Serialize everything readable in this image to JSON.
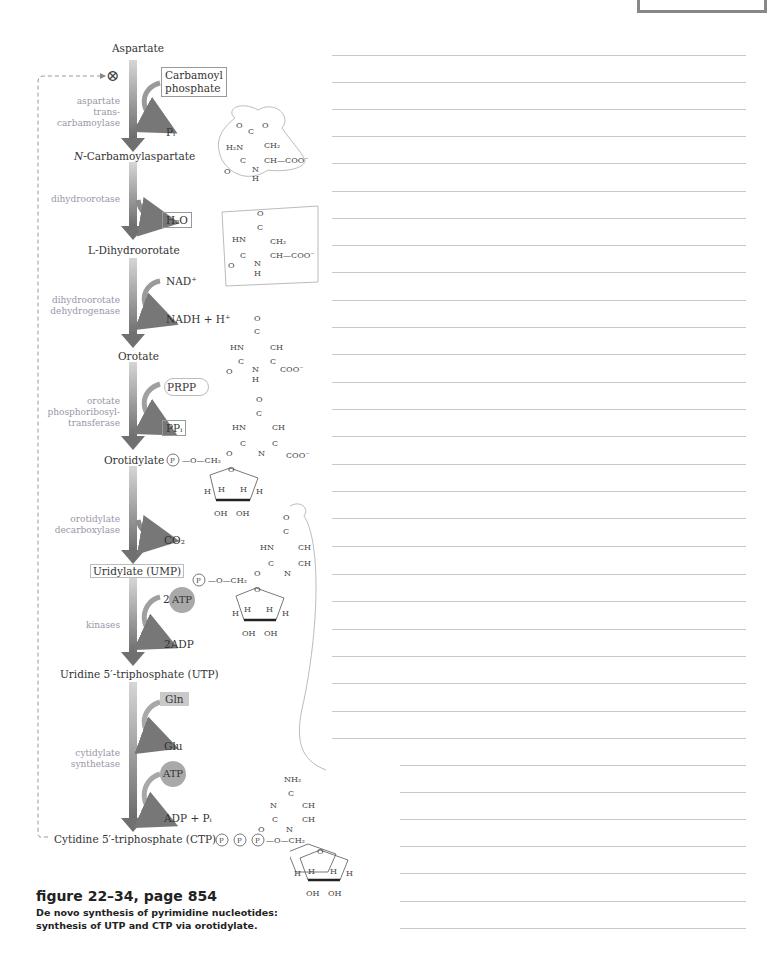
{
  "figure": {
    "title": "figure 22–34, page 854",
    "caption_line1": "De novo synthesis of pyrimidine nucleotides:",
    "caption_line2": "synthesis of UTP and CTP via orotidylate."
  },
  "pathway": {
    "feedback_inhibition_symbol": "⊗",
    "metabolites": [
      {
        "name": "Aspartate"
      },
      {
        "name": "N-Carbamoylaspartate",
        "prefix_italic": "N",
        "rest": "-Carbamoylaspartate"
      },
      {
        "name": "L-Dihydroorotate"
      },
      {
        "name": "Orotate"
      },
      {
        "name": "Orotidylate"
      },
      {
        "name": "Uridylate (UMP)"
      },
      {
        "name": "Uridine 5′-triphosphate (UTP)"
      },
      {
        "name": "Cytidine 5′-triphosphate (CTP)"
      }
    ],
    "enzymes": [
      {
        "lines": [
          "aspartate",
          "trans-",
          "carbamoylase"
        ]
      },
      {
        "lines": [
          "dihydroorotase"
        ]
      },
      {
        "lines": [
          "dihydroorotate",
          "dehydrogenase"
        ]
      },
      {
        "lines": [
          "orotate",
          "phosphoribosyl-",
          "transferase"
        ]
      },
      {
        "lines": [
          "orotidylate",
          "decarboxylase"
        ]
      },
      {
        "lines": [
          "kinases"
        ]
      },
      {
        "lines": [
          "cytidylate",
          "synthetase"
        ]
      }
    ],
    "side_inputs": {
      "carbamoyl_phosphate_1": "Carbamoyl",
      "carbamoyl_phosphate_2": "phosphate",
      "nad": "NAD⁺",
      "prpp": "PRPP",
      "two_atp_prefix": "2",
      "atp": "ATP",
      "gln": "Gln",
      "atp2": "ATP"
    },
    "side_outputs": {
      "pi": "Pᵢ",
      "h2o": "H₂O",
      "nadh": "NADH + H⁺",
      "ppi": "PPᵢ",
      "co2": "CO₂",
      "two_adp": "2ADP",
      "glu": "Glu",
      "adp_pi": "ADP + Pᵢ"
    }
  },
  "structures": {
    "phosphate_label": "P",
    "o_ch2": "O—CH₂",
    "atoms": {
      "O": "O",
      "C": "C",
      "N": "N",
      "H": "H",
      "HN": "HN",
      "H2N": "H₂N",
      "CH": "CH",
      "CH2": "CH₂",
      "COO": "COO⁻",
      "CH_COO": "CH—COO⁻",
      "OH": "OH",
      "NH2": "NH₂",
      "NH": "N\nH"
    }
  },
  "notes": {
    "ruled_line_count_full": 26,
    "ruled_line_count_short": 7
  },
  "colors": {
    "arrow_dark": "#6e6e6e",
    "arrow_light": "#d0d0d0",
    "enzyme_text": "#9b95a8",
    "rule": "#c8c8c8",
    "atp_fill": "#a9a9a9",
    "gln_fill": "#c9c9c9"
  }
}
